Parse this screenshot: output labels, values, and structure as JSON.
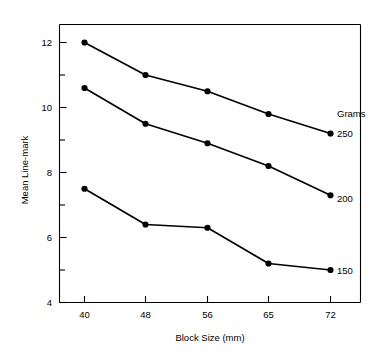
{
  "chart_data": {
    "type": "line",
    "title": "",
    "xlabel": "Block Size (mm)",
    "ylabel": "Mean Line-mark",
    "categories": [
      "40",
      "48",
      "56",
      "65",
      "72"
    ],
    "x": [
      40,
      48,
      56,
      65,
      72
    ],
    "ylim": [
      4,
      12.7
    ],
    "yticks_major": [
      "4",
      "6",
      "8",
      "10",
      "12"
    ],
    "yticks_major_values": [
      4,
      6,
      8,
      10,
      12
    ],
    "yticks_minor_values": [
      5,
      7,
      9,
      11
    ],
    "grid": false,
    "legend_position": "right-inline",
    "legend_title": "Grams",
    "series": [
      {
        "name": "250",
        "values": [
          12.0,
          11.0,
          10.5,
          9.8,
          9.2
        ]
      },
      {
        "name": "200",
        "values": [
          10.6,
          9.5,
          8.9,
          8.2,
          7.3
        ]
      },
      {
        "name": "150",
        "values": [
          7.5,
          6.4,
          6.3,
          5.2,
          5.0
        ]
      }
    ]
  },
  "labels": {
    "legend_title": "Grams",
    "series_250": "250",
    "series_200": "200",
    "series_150": "150",
    "xlabel": "Block Size (mm)",
    "ylabel": "Mean Line-mark",
    "y_4": "4",
    "y_6": "6",
    "y_8": "8",
    "y_10": "10",
    "y_12": "12",
    "x_40": "40",
    "x_48": "48",
    "x_56": "56",
    "x_65": "65",
    "x_72": "72"
  },
  "colors": {
    "line": "#000000",
    "marker": "#000000",
    "axis": "#000000",
    "background": "#ffffff"
  }
}
